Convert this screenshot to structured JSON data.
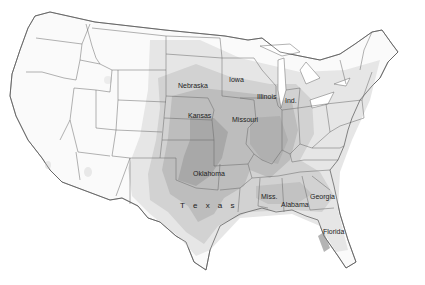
{
  "map": {
    "title": "",
    "region": "Contiguous United States",
    "shading": {
      "levels": [
        "#f2f2f2",
        "#e0e0e0",
        "#cdcdcd",
        "#b8b8b8",
        "#a2a2a2"
      ],
      "border_color": "#555555"
    },
    "labels": [
      {
        "id": "nebraska",
        "text": "Nebraska",
        "x": 178,
        "y": 111
      },
      {
        "id": "iowa",
        "text": "Iowa",
        "x": 229,
        "y": 106
      },
      {
        "id": "kansas",
        "text": "Kansas",
        "x": 190,
        "y": 140
      },
      {
        "id": "missouri",
        "text": "Missouri",
        "x": 232,
        "y": 146
      },
      {
        "id": "illinois",
        "text": "Illinois",
        "x": 257,
        "y": 130
      },
      {
        "id": "indiana",
        "text": "Ind.",
        "x": 286,
        "y": 127
      },
      {
        "id": "oklahoma",
        "text": "Oklahoma",
        "x": 193,
        "y": 173
      },
      {
        "id": "texas",
        "text": "T e x a s",
        "x": 182,
        "y": 204
      },
      {
        "id": "mississippi",
        "text": "Miss.",
        "x": 261,
        "y": 194
      },
      {
        "id": "alabama",
        "text": "Alabama",
        "x": 281,
        "y": 201
      },
      {
        "id": "georgia",
        "text": "Georgia",
        "x": 310,
        "y": 194
      },
      {
        "id": "florida",
        "text": "Florida",
        "x": 323,
        "y": 230
      }
    ]
  }
}
